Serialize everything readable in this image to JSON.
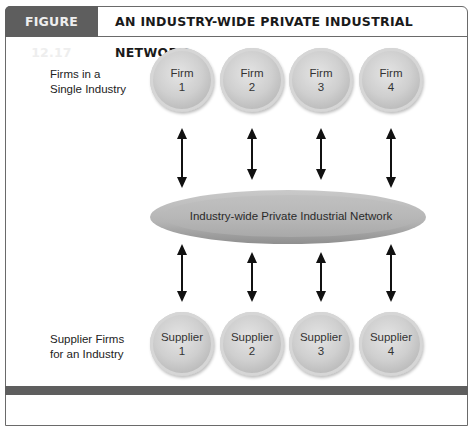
{
  "figure": {
    "number": "FIGURE 12.17",
    "title": "AN INDUSTRY-WIDE PRIVATE INDUSTRIAL NETWORK"
  },
  "rows": {
    "firms_label": [
      "Firms in a",
      "Single Industry"
    ],
    "suppliers_label": [
      "Supplier Firms",
      "for an Industry"
    ]
  },
  "firms": [
    {
      "name": "Firm",
      "num": "1"
    },
    {
      "name": "Firm",
      "num": "2"
    },
    {
      "name": "Firm",
      "num": "3"
    },
    {
      "name": "Firm",
      "num": "4"
    }
  ],
  "network": {
    "label": "Industry-wide Private Industrial Network"
  },
  "suppliers": [
    {
      "name": "Supplier",
      "num": "1"
    },
    {
      "name": "Supplier",
      "num": "2"
    },
    {
      "name": "Supplier",
      "num": "3"
    },
    {
      "name": "Supplier",
      "num": "4"
    }
  ],
  "colors": {
    "header_box": "#5e5e5e",
    "node": "#c8c8c8",
    "network": "#b3b3b3",
    "arrow": "#111111"
  }
}
